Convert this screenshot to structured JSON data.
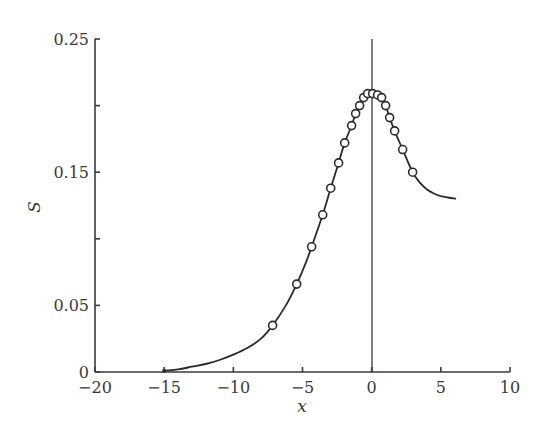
{
  "chart_data": {
    "type": "line",
    "title": "",
    "xlabel": "x",
    "ylabel": "S",
    "xlim": [
      -20,
      10
    ],
    "ylim": [
      0,
      0.25
    ],
    "grid": false,
    "legend": null,
    "x_ticks": [
      -20,
      -15,
      -10,
      -5,
      0,
      5,
      10
    ],
    "x_tick_labels": [
      "−20",
      "−15",
      "−10",
      "−5",
      "0",
      "5",
      "10"
    ],
    "y_ticks": [
      0,
      0.05,
      0.1,
      0.15,
      0.2,
      0.25
    ],
    "y_tick_labels": [
      "0",
      "0.05",
      "",
      "0.15",
      "",
      "0.25"
    ],
    "vertical_reference_line": {
      "x": 0
    },
    "series": [
      {
        "name": "curve",
        "style": "line",
        "x": [
          -15,
          -14,
          -13,
          -12,
          -11,
          -10,
          -9,
          -8,
          -7.16,
          -6.2,
          -5.42,
          -4.8,
          -4.34,
          -3.54,
          -2.96,
          -2.39,
          -1.95,
          -1.45,
          -1.16,
          -0.87,
          -0.58,
          -0.29,
          0.07,
          0.43,
          0.72,
          1.01,
          1.3,
          1.66,
          2.24,
          2.96,
          3.5,
          4.0,
          4.5,
          5.0,
          5.5,
          6.1
        ],
        "y": [
          0.001,
          0.002,
          0.004,
          0.006,
          0.009,
          0.013,
          0.018,
          0.025,
          0.035,
          0.05,
          0.066,
          0.081,
          0.094,
          0.118,
          0.138,
          0.157,
          0.172,
          0.185,
          0.194,
          0.2,
          0.206,
          0.209,
          0.209,
          0.208,
          0.206,
          0.2,
          0.191,
          0.181,
          0.167,
          0.15,
          0.142,
          0.137,
          0.134,
          0.132,
          0.131,
          0.13
        ]
      },
      {
        "name": "data points",
        "style": "markers",
        "marker": "open-circle",
        "x": [
          -7.16,
          -5.42,
          -4.34,
          -3.54,
          -2.96,
          -2.39,
          -1.95,
          -1.45,
          -1.16,
          -0.87,
          -0.58,
          -0.29,
          0.07,
          0.43,
          0.72,
          1.01,
          1.3,
          1.66,
          2.24,
          2.96
        ],
        "y": [
          0.035,
          0.066,
          0.094,
          0.118,
          0.138,
          0.157,
          0.172,
          0.185,
          0.194,
          0.2,
          0.206,
          0.209,
          0.209,
          0.208,
          0.206,
          0.2,
          0.191,
          0.181,
          0.167,
          0.15
        ]
      }
    ]
  }
}
